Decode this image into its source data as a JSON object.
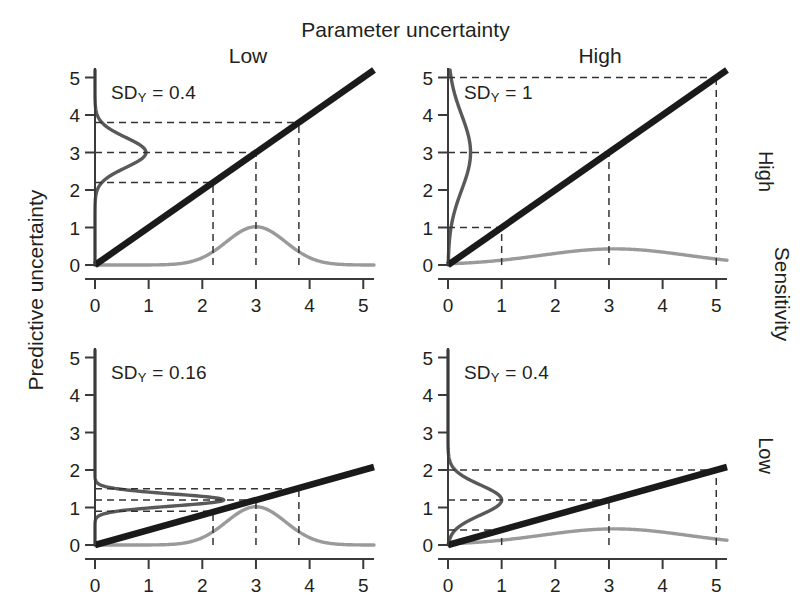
{
  "figure": {
    "column_group_title": "Parameter uncertainty",
    "column_headers": [
      "Low",
      "High"
    ],
    "row_group_title": "Sensitivity",
    "row_headers": [
      "High",
      "Low"
    ],
    "y_axis_label": "Predictive uncertainty",
    "colors": {
      "line": "#1a1a1a",
      "input_density": "#9a9a9a",
      "output_density": "#595959",
      "dash": "#333333",
      "axis": "#3a3a3a",
      "text": "#231f20",
      "background": "#ffffff"
    }
  },
  "chart_data": [
    {
      "type": "line",
      "panel_id": "top-left",
      "row": "High sensitivity",
      "column": "Low parameter uncertainty",
      "annotation": "SD_Y = 0.4",
      "annotation_prefix": "SD",
      "annotation_subscript": "Y",
      "annotation_value": "= 0.4",
      "sd_y": 0.4,
      "xlabel": "",
      "ylabel": "",
      "xlim": [
        0,
        5.2
      ],
      "ylim": [
        0,
        5.2
      ],
      "xticks": [
        0,
        1,
        2,
        3,
        4,
        5
      ],
      "yticks": [
        0,
        1,
        2,
        3,
        4,
        5
      ],
      "xtick_labels": [
        "0",
        "1",
        "2",
        "3",
        "4",
        "5"
      ],
      "ytick_labels": [
        "0",
        "1",
        "2",
        "3",
        "4",
        "5"
      ],
      "grid": false,
      "legend": "none",
      "transfer_line": {
        "slope": 1.0,
        "intercept": 0.0,
        "x_from": 0,
        "x_to": 5.2
      },
      "input_density": {
        "mean": 3.0,
        "sd": 0.55,
        "peak_height": 1.02
      },
      "output_density": {
        "mean": 3.0,
        "sd": 0.4,
        "peak_width": 0.95
      },
      "projection_x": [
        2.2,
        3.0,
        3.8
      ],
      "projection_y": [
        2.2,
        3.0,
        3.8
      ]
    },
    {
      "type": "line",
      "panel_id": "top-right",
      "row": "High sensitivity",
      "column": "High parameter uncertainty",
      "annotation": "SD_Y = 1",
      "annotation_prefix": "SD",
      "annotation_subscript": "Y",
      "annotation_value": "= 1",
      "sd_y": 1,
      "xlabel": "",
      "ylabel": "",
      "xlim": [
        0,
        5.2
      ],
      "ylim": [
        0,
        5.2
      ],
      "xticks": [
        0,
        1,
        2,
        3,
        4,
        5
      ],
      "yticks": [
        0,
        1,
        2,
        3,
        4,
        5
      ],
      "xtick_labels": [
        "0",
        "1",
        "2",
        "3",
        "4",
        "5"
      ],
      "ytick_labels": [
        "0",
        "1",
        "2",
        "3",
        "4",
        "5"
      ],
      "grid": false,
      "legend": "none",
      "transfer_line": {
        "slope": 1.0,
        "intercept": 0.0,
        "x_from": 0,
        "x_to": 5.2
      },
      "input_density": {
        "mean": 3.1,
        "sd": 1.35,
        "peak_height": 0.43
      },
      "output_density": {
        "mean": 3.0,
        "sd": 1.0,
        "peak_width": 0.42
      },
      "projection_x": [
        1.0,
        3.0,
        5.0
      ],
      "projection_y": [
        1.0,
        3.0,
        5.0
      ]
    },
    {
      "type": "line",
      "panel_id": "bottom-left",
      "row": "Low sensitivity",
      "column": "Low parameter uncertainty",
      "annotation": "SD_Y = 0.16",
      "annotation_prefix": "SD",
      "annotation_subscript": "Y",
      "annotation_value": "= 0.16",
      "sd_y": 0.16,
      "xlabel": "",
      "ylabel": "",
      "xlim": [
        0,
        5.2
      ],
      "ylim": [
        0,
        5.2
      ],
      "xticks": [
        0,
        1,
        2,
        3,
        4,
        5
      ],
      "yticks": [
        0,
        1,
        2,
        3,
        4,
        5
      ],
      "xtick_labels": [
        "0",
        "1",
        "2",
        "3",
        "4",
        "5"
      ],
      "ytick_labels": [
        "0",
        "1",
        "2",
        "3",
        "4",
        "5"
      ],
      "grid": false,
      "legend": "none",
      "transfer_line": {
        "slope": 0.4,
        "intercept": 0.0,
        "x_from": 0,
        "x_to": 5.2
      },
      "input_density": {
        "mean": 3.0,
        "sd": 0.55,
        "peak_height": 1.02
      },
      "output_density": {
        "mean": 1.2,
        "sd": 0.16,
        "peak_width": 2.4
      },
      "projection_x": [
        2.2,
        3.0,
        3.8
      ],
      "projection_y": [
        0.9,
        1.2,
        1.5
      ]
    },
    {
      "type": "line",
      "panel_id": "bottom-right",
      "row": "Low sensitivity",
      "column": "High parameter uncertainty",
      "annotation": "SD_Y = 0.4",
      "annotation_prefix": "SD",
      "annotation_subscript": "Y",
      "annotation_value": "= 0.4",
      "sd_y": 0.4,
      "xlabel": "",
      "ylabel": "",
      "xlim": [
        0,
        5.2
      ],
      "ylim": [
        0,
        5.2
      ],
      "xticks": [
        0,
        1,
        2,
        3,
        4,
        5
      ],
      "yticks": [
        0,
        1,
        2,
        3,
        4,
        5
      ],
      "xtick_labels": [
        "0",
        "1",
        "2",
        "3",
        "4",
        "5"
      ],
      "ytick_labels": [
        "0",
        "1",
        "2",
        "3",
        "4",
        "5"
      ],
      "grid": false,
      "legend": "none",
      "transfer_line": {
        "slope": 0.4,
        "intercept": 0.0,
        "x_from": 0,
        "x_to": 5.2
      },
      "input_density": {
        "mean": 3.1,
        "sd": 1.35,
        "peak_height": 0.43
      },
      "output_density": {
        "mean": 1.2,
        "sd": 0.4,
        "peak_width": 1.0
      },
      "projection_x": [
        1.0,
        3.0,
        5.0
      ],
      "projection_y": [
        0.4,
        1.2,
        2.0
      ]
    }
  ]
}
